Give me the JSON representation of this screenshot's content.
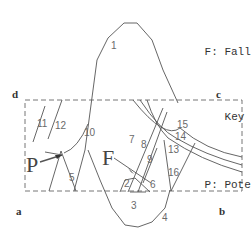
{
  "legend": {
    "items": [
      {
        "key": "F:",
        "line1": "Falling",
        "line2": "Key Block"
      },
      {
        "key": "P:",
        "line1": "Potential",
        "line2": "Key block"
      }
    ]
  },
  "corners": {
    "a": "a",
    "b": "b",
    "c": "c",
    "d": "d"
  },
  "blocks": {
    "F": "F",
    "P": "P"
  },
  "fracture_labels": [
    "1",
    "2",
    "3",
    "4",
    "5",
    "6",
    "7",
    "8",
    "9",
    "10",
    "11",
    "12",
    "13",
    "14",
    "15",
    "16"
  ],
  "colors": {
    "line": "#555555",
    "text": "#333333",
    "dashed_box": "#777777"
  }
}
